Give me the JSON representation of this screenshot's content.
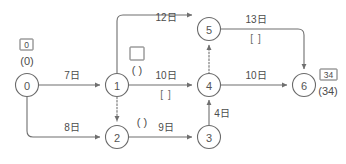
{
  "diagram": {
    "unit_suffix": "日",
    "colors": {
      "stroke": "#6a6a6a",
      "text": "#4c4c4c",
      "background": "#ffffff"
    },
    "nodes": [
      {
        "id": "node-0",
        "label": "0",
        "cx": 27,
        "cy": 85
      },
      {
        "id": "node-1",
        "label": "1",
        "cx": 117,
        "cy": 85
      },
      {
        "id": "node-2",
        "label": "2",
        "cx": 117,
        "cy": 137
      },
      {
        "id": "node-3",
        "label": "3",
        "cx": 209,
        "cy": 137
      },
      {
        "id": "node-4",
        "label": "4",
        "cx": 209,
        "cy": 85
      },
      {
        "id": "node-5",
        "label": "5",
        "cx": 209,
        "cy": 29
      },
      {
        "id": "node-6",
        "label": "6",
        "cx": 304,
        "cy": 85
      }
    ],
    "edges": [
      {
        "id": "edge-0-1",
        "from": "0",
        "to": "1",
        "duration": "7日",
        "blank": "",
        "style": "solid"
      },
      {
        "id": "edge-0-2",
        "from": "0",
        "to": "2",
        "duration": "8日",
        "blank": "",
        "style": "solid"
      },
      {
        "id": "edge-1-5",
        "from": "1",
        "to": "5",
        "duration": "12日",
        "blank": "",
        "style": "solid"
      },
      {
        "id": "edge-1-4",
        "from": "1",
        "to": "4",
        "duration": "10日",
        "blank": "[ ]",
        "style": "solid"
      },
      {
        "id": "edge-1-2",
        "from": "1",
        "to": "2",
        "duration": "",
        "blank": "",
        "style": "dashed"
      },
      {
        "id": "edge-2-3",
        "from": "2",
        "to": "3",
        "duration": "9日",
        "blank": "",
        "style": "solid"
      },
      {
        "id": "edge-3-4",
        "from": "3",
        "to": "4",
        "duration": "4日",
        "blank": "",
        "style": "solid"
      },
      {
        "id": "edge-4-5",
        "from": "4",
        "to": "5",
        "duration": "",
        "blank": "",
        "style": "dashed"
      },
      {
        "id": "edge-4-6",
        "from": "4",
        "to": "6",
        "duration": "10日",
        "blank": "",
        "style": "solid"
      },
      {
        "id": "edge-5-6",
        "from": "5",
        "to": "6",
        "duration": "13日",
        "blank": "[ ]",
        "style": "solid"
      }
    ],
    "annotations": [
      {
        "id": "annot-node-0",
        "attached_to": "node-0",
        "boxed_value": "0",
        "paren_value": "(0)",
        "box_x": 27,
        "box_y": 45,
        "paren_x": 27,
        "paren_y": 61
      },
      {
        "id": "annot-node-6",
        "attached_to": "node-6",
        "boxed_value": "34",
        "paren_value": "(34)",
        "box_x": 328,
        "box_y": 75,
        "paren_x": 328,
        "paren_y": 91
      },
      {
        "id": "annot-node-1",
        "attached_to": "node-1",
        "boxed_value": "",
        "paren_value": "( )",
        "box_x": 137,
        "box_y": 53,
        "paren_x": 137,
        "paren_y": 70
      },
      {
        "id": "annot-node-2",
        "attached_to": "node-2",
        "boxed_value": null,
        "paren_value": "( )",
        "paren_x": 142,
        "paren_y": 122
      }
    ],
    "edge_label_positions": {
      "edge-0-1": {
        "x": 72,
        "y": 79
      },
      "edge-0-2": {
        "x": 72,
        "y": 131
      },
      "edge-1-5": {
        "x": 166,
        "y": 21
      },
      "edge-1-4": {
        "x": 166,
        "y": 79
      },
      "edge-1-4-blank": {
        "x": 166,
        "y": 96
      },
      "edge-2-3": {
        "x": 166,
        "y": 131
      },
      "edge-3-4": {
        "x": 221,
        "y": 115
      },
      "edge-4-6": {
        "x": 258,
        "y": 79
      },
      "edge-5-6": {
        "x": 256,
        "y": 23
      },
      "edge-5-6-blank": {
        "x": 256,
        "y": 40
      }
    }
  }
}
